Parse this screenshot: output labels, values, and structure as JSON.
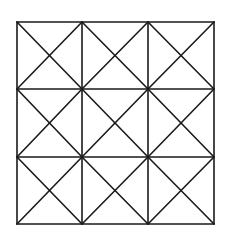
{
  "diagram": {
    "type": "grid-with-diagonals",
    "rows": 3,
    "cols": 3,
    "stroke_color": "#1a1a1a",
    "stroke_width": 1.6,
    "background": "#ffffff",
    "corners": {
      "top_left": [
        17,
        22
      ],
      "top_right": [
        214,
        22
      ],
      "bottom_left": [
        16,
        223
      ],
      "bottom_right": [
        214,
        224
      ]
    },
    "x_lines": [
      17,
      82,
      148,
      214
    ],
    "y_lines": [
      22,
      89,
      157,
      224
    ],
    "each_cell_has_both_diagonals": true
  }
}
